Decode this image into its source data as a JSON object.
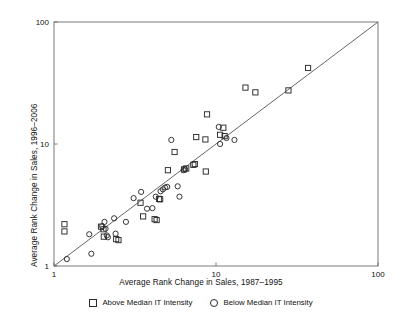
{
  "chart_data": {
    "type": "scatter",
    "title": "",
    "xlabel": "Average Rank Change in Sales, 1987–1995",
    "ylabel": "Average Rank Change in Sales, 1996–2006",
    "xscale": "log",
    "yscale": "log",
    "xlim": [
      1,
      100
    ],
    "ylim": [
      1,
      100
    ],
    "xticks": [
      1,
      10,
      100
    ],
    "xtick_labels": [
      "1",
      "10",
      "100"
    ],
    "yticks": [
      1,
      10,
      100
    ],
    "ytick_labels": [
      "1",
      "10",
      "100"
    ],
    "grid": false,
    "legend_position": "below",
    "reference_line": {
      "name": "45-degree-line",
      "from": [
        1,
        1
      ],
      "to": [
        100,
        100
      ],
      "color": "#555555"
    },
    "series": [
      {
        "name": "Above Median IT Intensity",
        "marker": "square",
        "color": "#2b2b2b",
        "points": [
          [
            1.16,
            2.2
          ],
          [
            1.16,
            1.92
          ],
          [
            1.95,
            2.1
          ],
          [
            2.02,
            2.0
          ],
          [
            2.03,
            1.74
          ],
          [
            2.42,
            1.66
          ],
          [
            2.5,
            1.63
          ],
          [
            3.42,
            3.3
          ],
          [
            3.55,
            2.55
          ],
          [
            4.18,
            2.42
          ],
          [
            4.3,
            2.38
          ],
          [
            4.45,
            3.55
          ],
          [
            4.52,
            3.52
          ],
          [
            5.05,
            6.1
          ],
          [
            5.55,
            8.6
          ],
          [
            6.35,
            6.2
          ],
          [
            6.55,
            6.3
          ],
          [
            7.25,
            6.75
          ],
          [
            7.4,
            6.85
          ],
          [
            7.55,
            11.4
          ],
          [
            8.6,
            10.9
          ],
          [
            8.65,
            5.95
          ],
          [
            8.8,
            17.5
          ],
          [
            10.6,
            11.9
          ],
          [
            11.1,
            13.6
          ],
          [
            11.3,
            11.6
          ],
          [
            15.2,
            29.0
          ],
          [
            17.5,
            26.5
          ],
          [
            28.0,
            27.5
          ],
          [
            37.0,
            42.0
          ]
        ]
      },
      {
        "name": "Below Median IT Intensity",
        "marker": "circle",
        "color": "#2b2b2b",
        "points": [
          [
            1.2,
            1.14
          ],
          [
            1.65,
            1.82
          ],
          [
            1.7,
            1.26
          ],
          [
            1.98,
            2.12
          ],
          [
            2.05,
            2.3
          ],
          [
            2.08,
            2.02
          ],
          [
            2.12,
            1.78
          ],
          [
            2.15,
            1.72
          ],
          [
            2.35,
            2.46
          ],
          [
            2.4,
            1.84
          ],
          [
            2.78,
            2.3
          ],
          [
            3.1,
            3.6
          ],
          [
            3.45,
            4.05
          ],
          [
            3.75,
            2.95
          ],
          [
            4.05,
            2.98
          ],
          [
            4.25,
            3.7
          ],
          [
            4.55,
            4.1
          ],
          [
            4.7,
            4.25
          ],
          [
            4.85,
            4.4
          ],
          [
            5.0,
            4.45
          ],
          [
            5.3,
            10.8
          ],
          [
            5.8,
            4.5
          ],
          [
            5.95,
            3.7
          ],
          [
            6.3,
            6.1
          ],
          [
            6.45,
            6.2
          ],
          [
            10.4,
            13.8
          ],
          [
            10.6,
            10.0
          ],
          [
            11.6,
            11.2
          ],
          [
            13.0,
            10.8
          ]
        ]
      }
    ]
  },
  "legend": {
    "entries": [
      {
        "label": "Above Median IT Intensity",
        "marker": "square-marker-icon"
      },
      {
        "label": "Below Median IT Intensity",
        "marker": "circle-marker-icon"
      }
    ]
  }
}
